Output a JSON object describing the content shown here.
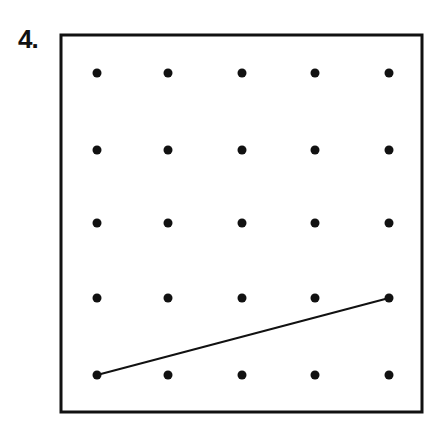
{
  "problem": {
    "number_label": "4."
  },
  "grid": {
    "rows": 5,
    "cols": 5,
    "x": [
      97,
      168,
      242,
      315,
      389
    ],
    "y": [
      73,
      150,
      223,
      298,
      375
    ],
    "dot_radius": 4.5,
    "dot_color": "#111111"
  },
  "frame": {
    "x": 61,
    "y": 35,
    "width": 361,
    "height": 377,
    "stroke": "#111111",
    "stroke_width": 3
  },
  "segments": [
    {
      "from": {
        "row": 5,
        "col": 1
      },
      "to": {
        "row": 4,
        "col": 5
      },
      "color": "#111111",
      "width": 2
    }
  ]
}
